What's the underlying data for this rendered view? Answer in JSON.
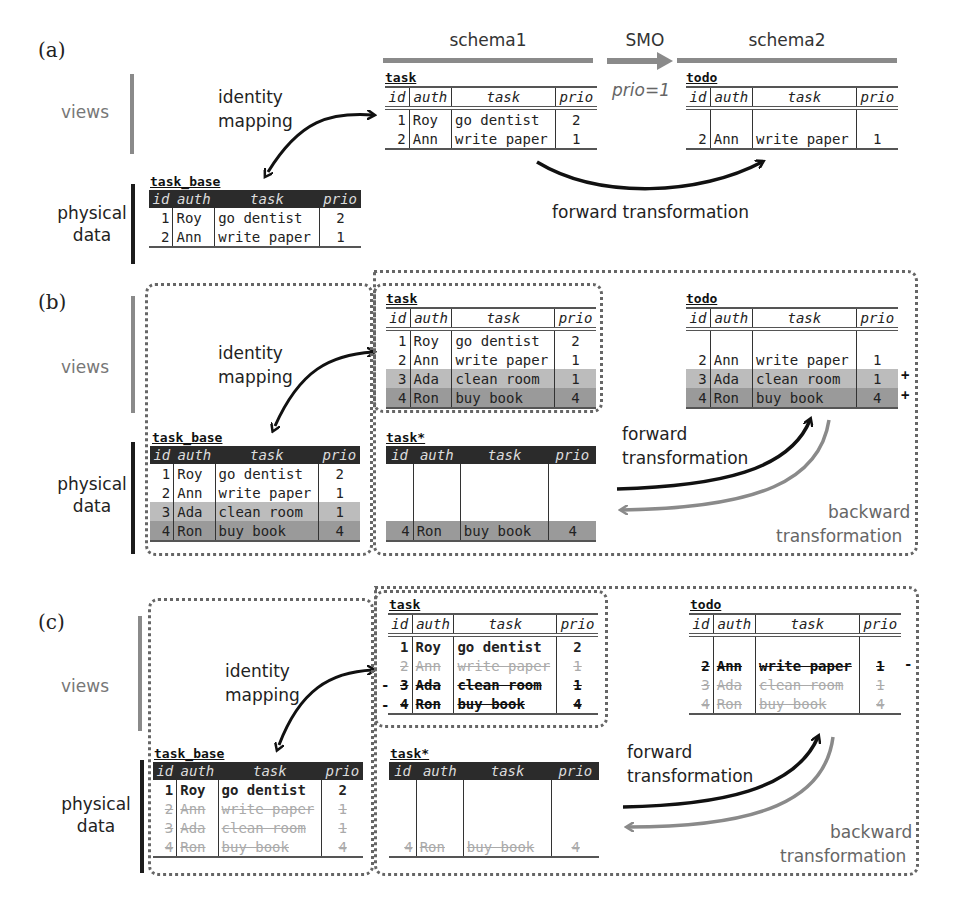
{
  "panels": {
    "a": {
      "label": "(a)",
      "views_label": "views",
      "physical_label_line1": "physical",
      "physical_label_line2": "data",
      "identity_line1": "identity",
      "identity_line2": "mapping",
      "schema1": "schema1",
      "schema2": "schema2",
      "smo": "SMO",
      "smo_condition": "prio=1",
      "forward": "forward transformation",
      "task_view": {
        "name": "task",
        "columns": [
          "id",
          "auth",
          "task",
          "prio"
        ],
        "rows": [
          [
            "1",
            "Roy",
            "go dentist",
            "2"
          ],
          [
            "2",
            "Ann",
            "write paper",
            "1"
          ]
        ]
      },
      "todo_view": {
        "name": "todo",
        "columns": [
          "id",
          "auth",
          "task",
          "prio"
        ],
        "rows": [
          [
            "",
            "",
            "",
            ""
          ],
          [
            "2",
            "Ann",
            "write paper",
            "1"
          ]
        ]
      },
      "task_base": {
        "name": "task_base",
        "columns": [
          "id",
          "auth",
          "task",
          "prio"
        ],
        "rows": [
          [
            "1",
            "Roy",
            "go dentist",
            "2"
          ],
          [
            "2",
            "Ann",
            "write paper",
            "1"
          ]
        ]
      }
    },
    "b": {
      "label": "(b)",
      "views_label": "views",
      "physical_label_line1": "physical",
      "physical_label_line2": "data",
      "identity_line1": "identity",
      "identity_line2": "mapping",
      "forward_line1": "forward",
      "forward_line2": "transformation",
      "backward_line1": "backward",
      "backward_line2": "transformation",
      "task_view": {
        "name": "task",
        "columns": [
          "id",
          "auth",
          "task",
          "prio"
        ],
        "rows": [
          [
            "1",
            "Roy",
            "go dentist",
            "2"
          ],
          [
            "2",
            "Ann",
            "write paper",
            "1"
          ],
          [
            "3",
            "Ada",
            "clean room",
            "1"
          ],
          [
            "4",
            "Ron",
            "buy book",
            "4"
          ]
        ]
      },
      "todo_view": {
        "name": "todo",
        "columns": [
          "id",
          "auth",
          "task",
          "prio"
        ],
        "rows": [
          [
            "",
            "",
            "",
            ""
          ],
          [
            "2",
            "Ann",
            "write paper",
            "1"
          ],
          [
            "3",
            "Ada",
            "clean room",
            "1"
          ],
          [
            "4",
            "Ron",
            "buy book",
            "4"
          ]
        ],
        "markers": [
          "+",
          "+"
        ]
      },
      "task_base": {
        "name": "task_base",
        "columns": [
          "id",
          "auth",
          "task",
          "prio"
        ],
        "rows": [
          [
            "1",
            "Roy",
            "go dentist",
            "2"
          ],
          [
            "2",
            "Ann",
            "write paper",
            "1"
          ],
          [
            "3",
            "Ada",
            "clean room",
            "1"
          ],
          [
            "4",
            "Ron",
            "buy book",
            "4"
          ]
        ]
      },
      "task_star": {
        "name": "task*",
        "columns": [
          "id",
          "auth",
          "task",
          "prio"
        ],
        "rows": [
          [
            "",
            "",
            "",
            ""
          ],
          [
            "",
            "",
            "",
            ""
          ],
          [
            "",
            "",
            "",
            ""
          ],
          [
            "4",
            "Ron",
            "buy book",
            "4"
          ]
        ]
      }
    },
    "c": {
      "label": "(c)",
      "views_label": "views",
      "physical_label_line1": "physical",
      "physical_label_line2": "data",
      "identity_line1": "identity",
      "identity_line2": "mapping",
      "forward_line1": "forward",
      "forward_line2": "transformation",
      "backward_line1": "backward",
      "backward_line2": "transformation",
      "task_view": {
        "name": "task",
        "columns": [
          "id",
          "auth",
          "task",
          "prio"
        ],
        "rows": [
          [
            "1",
            "Roy",
            "go dentist",
            "2"
          ],
          [
            "2",
            "Ann",
            "write paper",
            "1"
          ],
          [
            "3",
            "Ada",
            "clean room",
            "1"
          ],
          [
            "4",
            "Ron",
            "buy book",
            "4"
          ]
        ],
        "markers": [
          "-",
          "-"
        ]
      },
      "todo_view": {
        "name": "todo",
        "columns": [
          "id",
          "auth",
          "task",
          "prio"
        ],
        "rows": [
          [
            "",
            "",
            "",
            ""
          ],
          [
            "2",
            "Ann",
            "write paper",
            "1"
          ],
          [
            "3",
            "Ada",
            "clean room",
            "1"
          ],
          [
            "4",
            "Ron",
            "buy book",
            "4"
          ]
        ],
        "markers": [
          "-"
        ]
      },
      "task_base": {
        "name": "task_base",
        "columns": [
          "id",
          "auth",
          "task",
          "prio"
        ],
        "rows": [
          [
            "1",
            "Roy",
            "go dentist",
            "2"
          ],
          [
            "2",
            "Ann",
            "write paper",
            "1"
          ],
          [
            "3",
            "Ada",
            "clean room",
            "1"
          ],
          [
            "4",
            "Ron",
            "buy book",
            "4"
          ]
        ]
      },
      "task_star": {
        "name": "task*",
        "columns": [
          "id",
          "auth",
          "task",
          "prio"
        ],
        "rows": [
          [
            "",
            "",
            "",
            ""
          ],
          [
            "",
            "",
            "",
            ""
          ],
          [
            "",
            "",
            "",
            ""
          ],
          [
            "4",
            "Ron",
            "buy book",
            "4"
          ]
        ]
      }
    }
  },
  "colors": {
    "views_bar": "#8a8a8a",
    "physical_bar": "#1c1c1c",
    "inserted_row_light": "#bcbcbc",
    "inserted_row_dark": "#9a9a9a",
    "header_dark": "#2b2b2b",
    "backward_arrow": "#8a8a8a"
  }
}
